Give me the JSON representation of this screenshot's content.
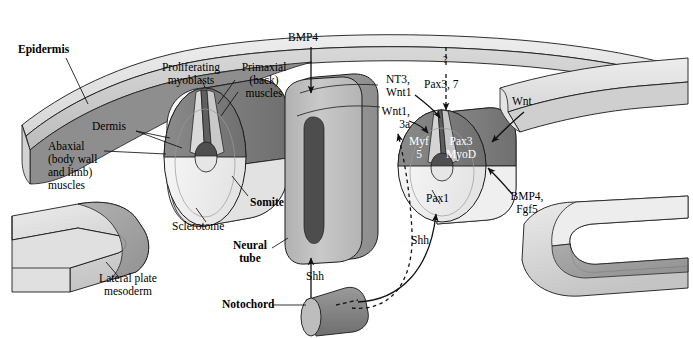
{
  "figure": {
    "domain": "diagram",
    "background_color": "#ffffff",
    "width": 693,
    "height": 338
  },
  "palette": {
    "outline": "#1a1a1a",
    "epidermis_top": "#e3e3e3",
    "epidermis_face": "#cfcfcf",
    "epidermis_under": "#8e8e8e",
    "dermomyotome_dark": "#7d7d7d",
    "dermomyotome_mid": "#9a9a9a",
    "sclerotome_light": "#f1f1f1",
    "sclerotome_shade": "#dcdcdc",
    "neural_tube_light": "#bdbdbd",
    "neural_tube_dark": "#9c9c9c",
    "lumen": "#5a5a5a",
    "notochord": "#8a8a8a",
    "lateral_plate_light": "#e8e8e8",
    "lateral_plate_mid": "#c8c8c8",
    "lateral_plate_dark": "#969696"
  },
  "labels": {
    "epidermis": {
      "text": "Epidermis",
      "bold": true,
      "x": 18,
      "y": 49
    },
    "proliferating_myoblasts": {
      "text": "Proliferating\nmyoblasts",
      "bold": false,
      "x": 156,
      "y": 67
    },
    "primaxial_muscles": {
      "text": "Primaxial\n(back)\nmuscles",
      "bold": false,
      "x": 238,
      "y": 67
    },
    "dermis": {
      "text": "Dermis",
      "bold": false,
      "x": 96,
      "y": 126
    },
    "abaxial_muscles": {
      "text": "Abaxial\n(body wall\nand limb)\nmuscles",
      "bold": false,
      "x": 51,
      "y": 146
    },
    "somite": {
      "text": "Somite",
      "bold": true,
      "x": 227,
      "y": 203
    },
    "sclerotome": {
      "text": "Sclerotome",
      "bold": false,
      "x": 177,
      "y": 226
    },
    "lateral_plate_mesoderm": {
      "text": "Lateral plate\nmesoderm",
      "bold": false,
      "x": 88,
      "y": 279
    },
    "bmp4_top": {
      "text": "BMP4",
      "bold": false,
      "x": 287,
      "y": 37
    },
    "nt3_wnt1": {
      "text": "NT3,\nWnt1",
      "bold": false,
      "x": 389,
      "y": 79
    },
    "wnt1_3a": {
      "text": "Wnt1,\n3a",
      "bold": false,
      "x": 389,
      "y": 111
    },
    "question_mark": {
      "text": "?",
      "bold": false,
      "x": 444,
      "y": 62
    },
    "pax3_7": {
      "text": "Pax3, 7",
      "bold": false,
      "x": 427,
      "y": 84
    },
    "wnt_right": {
      "text": "Wnt",
      "bold": false,
      "x": 512,
      "y": 101
    },
    "myf5": {
      "text": "Myf\n5",
      "bold": false,
      "white": true,
      "x": 414,
      "y": 141
    },
    "pax3_myod": {
      "text": "Pax3\nMyoD",
      "bold": false,
      "white": true,
      "x": 446,
      "y": 141
    },
    "pax1": {
      "text": "Pax1",
      "bold": false,
      "x": 429,
      "y": 198
    },
    "bmp4_fgf5": {
      "text": "BMP4,\nFgf5",
      "bold": false,
      "x": 511,
      "y": 196
    },
    "neural_tube": {
      "text": "Neural\ntube",
      "bold": true,
      "x": 241,
      "y": 245
    },
    "shh_vertical": {
      "text": "Shh",
      "bold": false,
      "x": 307,
      "y": 276
    },
    "shh_curved": {
      "text": "Shh",
      "bold": false,
      "x": 412,
      "y": 240
    },
    "notochord": {
      "text": "Notochord",
      "bold": true,
      "x": 226,
      "y": 301
    }
  },
  "structures": [
    {
      "name": "epidermis-sheet",
      "kind": "curved-sheet",
      "description": "Curved ectodermal sheet arching across the top of the figure from lower-left to right."
    },
    {
      "name": "left-somite",
      "kind": "cylinder",
      "description": "Cut somite cylinder on the left showing dermis, proliferating myoblasts, abaxial and primaxial muscle domains above the sclerotome."
    },
    {
      "name": "neural-tube",
      "kind": "block",
      "description": "Central neural tube block with a dark slit-shaped lumen."
    },
    {
      "name": "right-somite",
      "kind": "cylinder",
      "description": "Right somite cylinder annotated with Myf5, Pax3/MyoD in the dermomyotome and Pax1 in the sclerotome."
    },
    {
      "name": "notochord",
      "kind": "cylinder",
      "description": "Small notochord cylinder beneath the neural tube."
    },
    {
      "name": "left-lateral-plate",
      "kind": "forked-block",
      "description": "Forked lateral plate mesoderm block at lower left."
    },
    {
      "name": "right-lateral-plate-upper",
      "kind": "slab",
      "description": "Upper lateral slab at the right."
    },
    {
      "name": "right-lateral-plate-lower",
      "kind": "forked-block",
      "description": "Forked lateral plate mesoderm block at lower right."
    }
  ],
  "arrows": [
    {
      "name": "bmp4-to-neural-tube",
      "style": "solid",
      "from": "BMP4 label",
      "to": "neural tube dorsal surface"
    },
    {
      "name": "pax3-7-dashed",
      "style": "dashed",
      "from": "question mark",
      "to": "dorsal somite"
    },
    {
      "name": "nt3-wnt1-to-somite",
      "style": "solid",
      "from": "NT3, Wnt1 label",
      "to": "dorsomedial somite"
    },
    {
      "name": "wnt1-3a-to-somite",
      "style": "solid",
      "from": "Wnt1, 3a label",
      "to": "dorsomedial somite lip"
    },
    {
      "name": "wnt-to-somite",
      "style": "solid",
      "from": "Wnt label",
      "to": "dorsolateral somite"
    },
    {
      "name": "bmp4-fgf5-to-somite",
      "style": "solid",
      "from": "BMP4, Fgf5 label",
      "to": "lateral somite"
    },
    {
      "name": "shh-notochord-to-neural-tube",
      "style": "solid",
      "from": "notochord",
      "to": "ventral neural tube"
    },
    {
      "name": "shh-notochord-to-somite",
      "style": "solid",
      "from": "notochord",
      "to": "sclerotome (Pax1)"
    },
    {
      "name": "shh-dashed-diffusion",
      "style": "dashed",
      "from": "notochord",
      "to": "dorsomedial somite"
    }
  ],
  "leaders": [
    {
      "name": "epidermis-leader",
      "from": "Epidermis label",
      "to": "epidermis sheet"
    },
    {
      "name": "proliferating-myoblasts-leader",
      "from": "Proliferating myoblasts label",
      "to": "left somite myotome"
    },
    {
      "name": "primaxial-leader",
      "from": "Primaxial (back) muscles label",
      "to": "left somite dorsomedial lip"
    },
    {
      "name": "dermis-leader",
      "from": "Dermis label",
      "to": "left somite dermatome"
    },
    {
      "name": "abaxial-leader",
      "from": "Abaxial muscles label",
      "to": "left somite lateral lip"
    },
    {
      "name": "somite-leader",
      "from": "Somite label",
      "to": "left somite body"
    },
    {
      "name": "sclerotome-leader",
      "from": "Sclerotome label",
      "to": "left somite sclerotome"
    },
    {
      "name": "lateral-plate-leader",
      "from": "Lateral plate mesoderm label",
      "to": "left lateral plate block"
    },
    {
      "name": "neural-tube-leader",
      "from": "Neural tube label",
      "to": "neural tube block"
    },
    {
      "name": "notochord-leader",
      "from": "Notochord label",
      "to": "notochord cylinder"
    }
  ]
}
